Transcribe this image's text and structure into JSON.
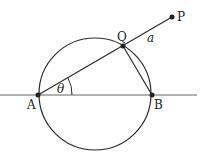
{
  "diagram": {
    "line_color": "#2a2a2a",
    "labels": {
      "A": "A",
      "B": "B",
      "Q": "Q",
      "P": "P",
      "a": "a",
      "theta": "θ"
    },
    "points": {
      "A": [
        38,
        95
      ],
      "B": [
        152,
        95
      ],
      "Q": [
        123,
        46
      ],
      "P": [
        172,
        17
      ]
    },
    "circle": {
      "cx": 95,
      "cy": 94,
      "r": 56
    }
  }
}
